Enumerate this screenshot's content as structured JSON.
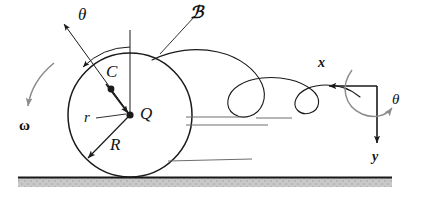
{
  "figure": {
    "background_color": "#ffffff",
    "stroke_color": "#1a1a1a",
    "accent_gray": "#8c8c8c",
    "ground_fill": "#c9c9c9"
  },
  "labels": {
    "theta_disk": "θ",
    "body_B": "ℬ",
    "point_C": "C",
    "point_Q": "Q",
    "radius_r": "r",
    "radius_R": "R",
    "omega": "ω",
    "axis_x": "x",
    "axis_y": "y",
    "theta_axes": "θ"
  },
  "geometry": {
    "disk_center": {
      "x": 130,
      "y": 115
    },
    "disk_radius": 62,
    "point_C": {
      "x": 111,
      "y": 89
    },
    "point_Q": {
      "x": 130,
      "y": 115
    },
    "r_length": 32,
    "R_length": 62,
    "theta_degrees": 36,
    "ground_y": 177,
    "axes_origin": {
      "x": 377,
      "y": 86
    },
    "x_arrow_tip": {
      "x": 322,
      "y": 86
    },
    "y_arrow_tip": {
      "x": 377,
      "y": 150
    }
  },
  "annotations": {
    "omega_direction": "counterclockwise-indicator-arrow-downward-left",
    "theta_axes_direction": "clockwise-from-x-to-y",
    "cycloid_type": "prolate-trochoid-with-loops",
    "ground_hatch_lines": 3
  }
}
